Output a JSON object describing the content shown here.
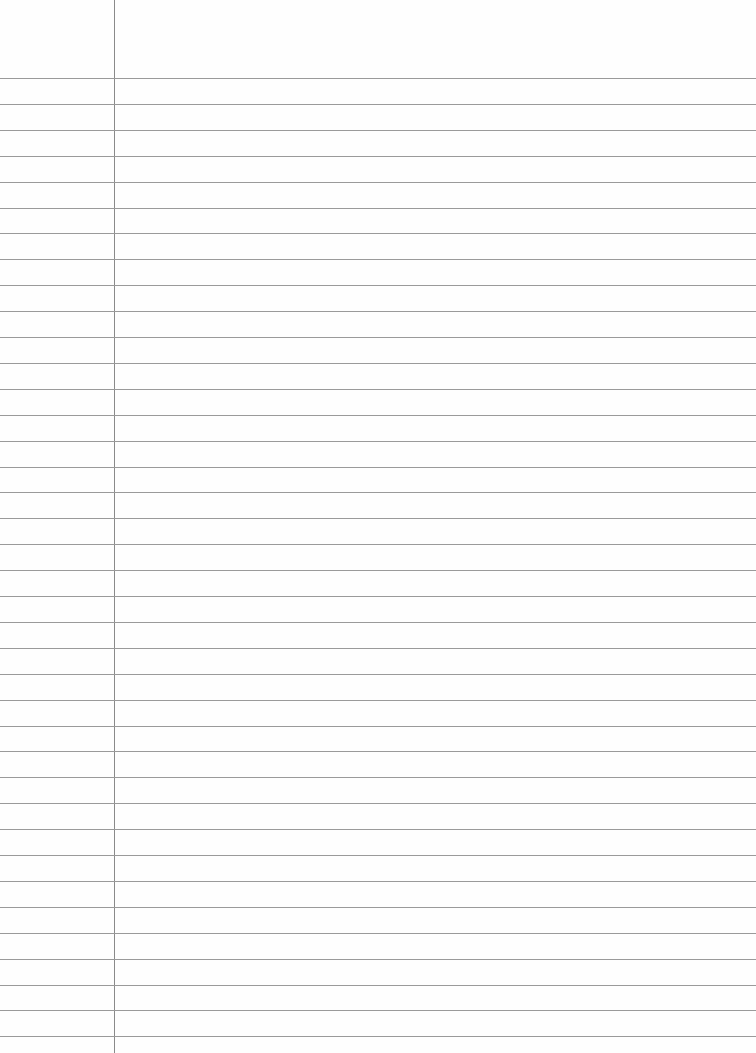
{
  "page": {
    "type": "lined-paper",
    "background_color": "#fefefe",
    "margin_line": {
      "x": 114,
      "color": "#8a8a8a"
    },
    "rules": {
      "first_y": 78,
      "spacing": 25.9,
      "count": 38,
      "color": "#9a9a9a"
    },
    "text": ""
  }
}
